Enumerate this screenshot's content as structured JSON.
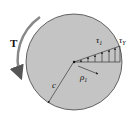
{
  "diagram": {
    "labels": {
      "torque": "T",
      "tau1": "τ",
      "tau1_sub": "1",
      "tauY": "τ",
      "tauY_sub": "Y",
      "rho1": "ρ",
      "rho1_sub": "1",
      "radius": "c"
    },
    "colors": {
      "shaft_fill": "#c4c4c4",
      "stroke": "#333333",
      "background": "#ffffff"
    }
  }
}
